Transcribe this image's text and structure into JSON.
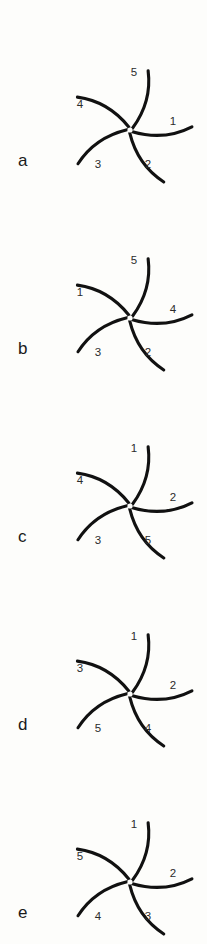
{
  "figure": {
    "background_color": "#fdfdfb",
    "stroke_color": "#111111",
    "label_color": "#2b2b2b",
    "panel_count": 5
  },
  "geometry": {
    "center_x": 130,
    "center_y": 130,
    "arm_length": 62,
    "arm_count": 5,
    "arm_base_angles_deg": [
      325,
      35,
      95,
      185,
      250
    ],
    "label_radius": 52,
    "label_angles_deg": [
      355,
      65,
      140,
      215,
      290
    ]
  },
  "panels": [
    {
      "letter": "a",
      "letter_x": 18,
      "letter_y": 152,
      "sector_labels": [
        "1",
        "2",
        "3",
        "4",
        "5"
      ],
      "sectors": [
        {
          "label": "1",
          "x": 173,
          "y": 122
        },
        {
          "label": "2",
          "x": 148,
          "y": 165
        },
        {
          "label": "3",
          "x": 98,
          "y": 165
        },
        {
          "label": "4",
          "x": 80,
          "y": 105
        },
        {
          "label": "5",
          "x": 134,
          "y": 73
        }
      ]
    },
    {
      "letter": "b",
      "letter_x": 18,
      "letter_y": 152,
      "sector_labels": [
        "4",
        "2",
        "3",
        "1",
        "5"
      ],
      "sectors": [
        {
          "label": "4",
          "x": 173,
          "y": 122
        },
        {
          "label": "2",
          "x": 148,
          "y": 165
        },
        {
          "label": "3",
          "x": 98,
          "y": 165
        },
        {
          "label": "1",
          "x": 80,
          "y": 105
        },
        {
          "label": "5",
          "x": 134,
          "y": 73
        }
      ]
    },
    {
      "letter": "c",
      "letter_x": 18,
      "letter_y": 152,
      "sector_labels": [
        "2",
        "5",
        "3",
        "4",
        "1"
      ],
      "sectors": [
        {
          "label": "2",
          "x": 173,
          "y": 122
        },
        {
          "label": "5",
          "x": 148,
          "y": 165
        },
        {
          "label": "3",
          "x": 98,
          "y": 165
        },
        {
          "label": "4",
          "x": 80,
          "y": 105
        },
        {
          "label": "1",
          "x": 134,
          "y": 73
        }
      ]
    },
    {
      "letter": "d",
      "letter_x": 18,
      "letter_y": 152,
      "sector_labels": [
        "2",
        "4",
        "5",
        "3",
        "1"
      ],
      "sectors": [
        {
          "label": "2",
          "x": 173,
          "y": 122
        },
        {
          "label": "4",
          "x": 148,
          "y": 165
        },
        {
          "label": "5",
          "x": 98,
          "y": 165
        },
        {
          "label": "3",
          "x": 80,
          "y": 105
        },
        {
          "label": "1",
          "x": 134,
          "y": 73
        }
      ]
    },
    {
      "letter": "e",
      "letter_x": 18,
      "letter_y": 152,
      "sector_labels": [
        "2",
        "3",
        "4",
        "5",
        "1"
      ],
      "sectors": [
        {
          "label": "2",
          "x": 173,
          "y": 122
        },
        {
          "label": "3",
          "x": 148,
          "y": 165
        },
        {
          "label": "4",
          "x": 98,
          "y": 165
        },
        {
          "label": "5",
          "x": 80,
          "y": 105
        },
        {
          "label": "1",
          "x": 134,
          "y": 73
        }
      ]
    }
  ],
  "panel_tops": [
    0,
    188,
    376,
    564,
    752
  ]
}
